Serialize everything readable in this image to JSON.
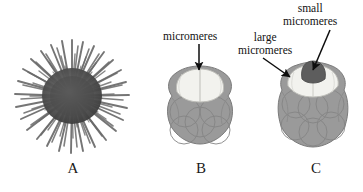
{
  "figure": {
    "background_color": "#ffffff",
    "width": 363,
    "height": 192
  },
  "panels": [
    {
      "letter": "A",
      "name": "sea-urchin-adult",
      "description": "adult sea urchin with radiating spines"
    },
    {
      "letter": "B",
      "name": "embryo-16-cell",
      "description": "cleavage-stage embryo with micromeres at animal-vegetal pole"
    },
    {
      "letter": "C",
      "name": "embryo-later-cleavage",
      "description": "cleavage-stage embryo with large and small micromeres"
    }
  ],
  "labels": {
    "micromeres": "micromeres",
    "large_micromeres_line1": "large",
    "large_micromeres_line2": "micromeres",
    "small_micromeres_line1": "small",
    "small_micromeres_line2": "micromeres"
  },
  "colors": {
    "blastomere_gray": "#9a9a9a",
    "blastomere_outline": "#7e7e7e",
    "micromere_white": "#f2f2ee",
    "micromere_white_outline": "#b4b4ae",
    "small_micromere_dark": "#5d5d5d",
    "urchin_spine": "#6e6e6e",
    "urchin_body": "#555555",
    "text": "#121212",
    "arrow": "#0d0d0d"
  }
}
